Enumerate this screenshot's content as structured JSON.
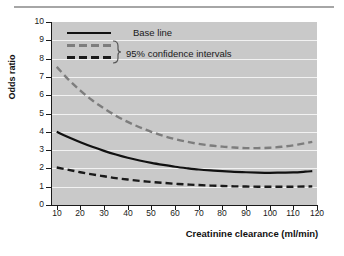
{
  "figure": {
    "background_color": "#ffffff",
    "plot_background_color": "#c9c9c9",
    "gridline_color": "#f2f2f2",
    "top_rule_color": "#a6a6a6"
  },
  "axes": {
    "y_title": "Odds ratio",
    "x_title": "Creatinine clearance (ml/min)",
    "y_ticks": [
      "0",
      "1",
      "2",
      "3",
      "4",
      "5",
      "6",
      "7",
      "8",
      "9",
      "10"
    ],
    "x_ticks": [
      "10",
      "20",
      "30",
      "40",
      "50",
      "60",
      "70",
      "80",
      "90",
      "100",
      "110",
      "120"
    ]
  },
  "legend": {
    "base_line_label": "Base line",
    "confidence_label": "95% confidence intervals",
    "base_line_color": "#111111",
    "upper_ci_color": "#7d7d7d",
    "lower_ci_color": "#1a1a1a"
  },
  "chart_data": {
    "type": "line",
    "title": "",
    "xlabel": "Creatinine clearance (ml/min)",
    "ylabel": "Odds ratio",
    "xlim": [
      8,
      120
    ],
    "ylim": [
      0,
      10
    ],
    "grid": true,
    "legend_position": "upper-left-inside",
    "x": [
      10,
      15,
      20,
      25,
      30,
      35,
      40,
      45,
      50,
      55,
      60,
      65,
      70,
      75,
      80,
      85,
      90,
      95,
      100,
      105,
      110,
      115,
      118
    ],
    "series": [
      {
        "name": "95% confidence intervals (upper)",
        "style": "dashed",
        "color": "#7d7d7d",
        "values": [
          7.55,
          6.85,
          6.25,
          5.72,
          5.28,
          4.88,
          4.54,
          4.25,
          4.0,
          3.78,
          3.6,
          3.46,
          3.34,
          3.25,
          3.19,
          3.14,
          3.11,
          3.11,
          3.13,
          3.18,
          3.26,
          3.38,
          3.45
        ]
      },
      {
        "name": "Base line",
        "style": "solid",
        "color": "#111111",
        "values": [
          4.0,
          3.7,
          3.43,
          3.18,
          2.96,
          2.76,
          2.58,
          2.43,
          2.3,
          2.19,
          2.09,
          2.01,
          1.94,
          1.89,
          1.85,
          1.81,
          1.79,
          1.77,
          1.76,
          1.77,
          1.78,
          1.82,
          1.85
        ]
      },
      {
        "name": "95% confidence intervals (lower)",
        "style": "dashed",
        "color": "#1a1a1a",
        "values": [
          2.05,
          1.92,
          1.79,
          1.67,
          1.57,
          1.47,
          1.39,
          1.32,
          1.26,
          1.21,
          1.16,
          1.12,
          1.09,
          1.06,
          1.04,
          1.02,
          1.01,
          1.0,
          1.0,
          1.0,
          1.0,
          1.01,
          1.02
        ]
      }
    ]
  }
}
